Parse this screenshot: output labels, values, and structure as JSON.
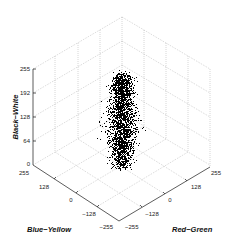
{
  "chart_data": {
    "type": "scatter",
    "subtype": "3d",
    "title": "",
    "axes": {
      "x": {
        "label": "Red−Green",
        "ticks": [
          "−255",
          "−128",
          "0",
          "128",
          "255"
        ],
        "range": [
          -255,
          255
        ]
      },
      "y": {
        "label": "Blue−Yellow",
        "ticks": [
          "255",
          "128",
          "0",
          "−128",
          "−255"
        ],
        "range": [
          -255,
          255
        ]
      },
      "z": {
        "label": "Black−White",
        "ticks": [
          "0",
          "64",
          "128",
          "192",
          "255"
        ],
        "range": [
          0,
          255
        ]
      }
    },
    "grid": true,
    "legend": null,
    "marker": {
      "shape": "dot",
      "color": "#000000",
      "size": 1
    },
    "point_cloud": {
      "description": "Dense vertical column of points centered near Red-Green≈0, Blue-Yellow≈0, spanning Black-White 0 to ~240",
      "count_estimate": 2500,
      "center": {
        "red_green": 0,
        "blue_yellow": 0
      },
      "spread_red_green": 30,
      "spread_blue_yellow": 30,
      "black_white_range": [
        0,
        240
      ]
    }
  },
  "labels": {
    "z_axis": "Black−White",
    "y_axis": "Blue−Yellow",
    "x_axis": "Red−Green",
    "z_ticks": [
      "255",
      "192",
      "128",
      "64",
      "0"
    ],
    "y_ticks": [
      "255",
      "128",
      "0",
      "−128",
      "−255"
    ],
    "x_ticks": [
      "−255",
      "−128",
      "0",
      "128",
      "255"
    ]
  }
}
